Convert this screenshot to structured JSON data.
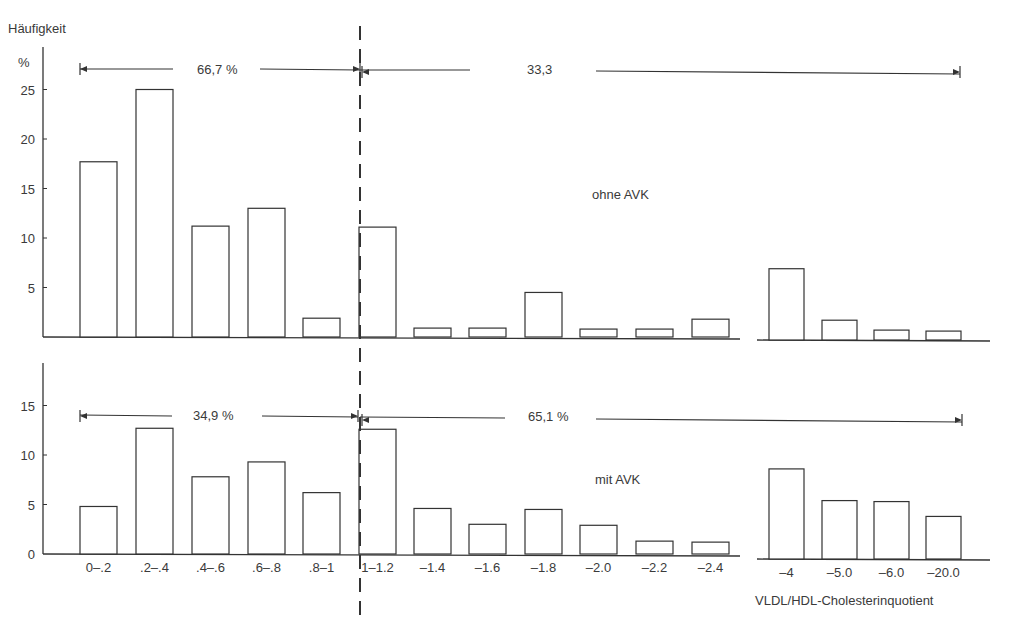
{
  "chart_data": [
    {
      "type": "bar",
      "panel": "top",
      "label": "ohne AVK",
      "ylabel": "Häufigkeit %",
      "xlabel": "VLDL/HDL-Cholesterinquotient",
      "yticks": [
        5,
        10,
        15,
        20,
        25
      ],
      "ylim": [
        0,
        25
      ],
      "categories": [
        "0–.2",
        ".2–.4",
        ".4–.6",
        ".6–.8",
        ".8–1",
        "1–1.2",
        "–1.4",
        "–1.6",
        "–1.8",
        "–2.0",
        "–2.2",
        "–2.4",
        "–4",
        "–5.0",
        "–6.0",
        "–20.0"
      ],
      "values": [
        17.7,
        25.0,
        11.2,
        13.0,
        1.9,
        11.1,
        0.9,
        0.9,
        4.5,
        0.8,
        0.8,
        1.8,
        7.2,
        2.0,
        1.0,
        0.9
      ],
      "annotations": [
        {
          "text": "66,7 %",
          "range": [
            "0–.2",
            "1–1.2 boundary"
          ]
        },
        {
          "text": "33,3",
          "range": [
            "1–1.2 boundary",
            "–20.0"
          ]
        }
      ]
    },
    {
      "type": "bar",
      "panel": "bottom",
      "label": "mit AVK",
      "yticks": [
        0,
        5,
        10,
        15
      ],
      "ylim": [
        0,
        19
      ],
      "categories": [
        "0–.2",
        ".2–.4",
        ".4–.6",
        ".6–.8",
        ".8–1",
        "1–1.2",
        "–1.4",
        "–1.6",
        "–1.8",
        "–2.0",
        "–2.2",
        "–2.4",
        "–4",
        "–5.0",
        "–6.0",
        "–20.0"
      ],
      "values": [
        4.8,
        12.7,
        7.8,
        9.3,
        6.2,
        12.6,
        4.6,
        3.0,
        4.5,
        2.9,
        1.3,
        1.2,
        9.1,
        5.9,
        5.8,
        4.3
      ],
      "annotations": [
        {
          "text": "34,9 %",
          "range": [
            "0–.2",
            "1–1.2 boundary"
          ]
        },
        {
          "text": "65,1 %",
          "range": [
            "1–1.2 boundary",
            "–20.0"
          ]
        }
      ]
    }
  ],
  "labels": {
    "y_title": "Häufigkeit",
    "y_unit": "%",
    "x_title": "VLDL/HDL-Cholesterinquotient",
    "top_group": "ohne AVK",
    "bottom_group": "mit AVK",
    "top_left_pct": "66,7 %",
    "top_right_pct": "33,3",
    "bottom_left_pct": "34,9 %",
    "bottom_right_pct": "65,1 %"
  },
  "colors": {
    "ink": "#333333",
    "background": "#ffffff"
  }
}
